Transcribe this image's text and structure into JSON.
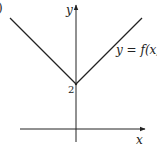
{
  "chart_data": {
    "type": "line",
    "title": "",
    "xlabel": "x",
    "ylabel": "y",
    "series": [
      {
        "name": "y = f(x)",
        "label": "y = f(x)",
        "points": [
          [
            -1,
            3
          ],
          [
            0,
            2
          ],
          [
            1,
            3
          ]
        ]
      }
    ],
    "annotations": [
      {
        "text": "2",
        "at": [
          0,
          2
        ],
        "meaning": "y-intercept"
      }
    ],
    "part_label": ")",
    "grid": false,
    "legend": "none"
  }
}
